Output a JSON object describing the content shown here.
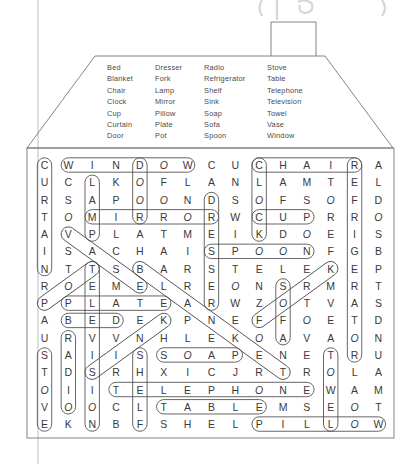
{
  "header": {
    "partial_title": "(page ...)"
  },
  "word_list": {
    "columns": [
      [
        "Bed",
        "Blanket",
        "Chair",
        "Clock",
        "Cup",
        "Curtain",
        "Door"
      ],
      [
        "Dresser",
        "Fork",
        "Lamp",
        "Mirror",
        "Pillow",
        "Plate",
        "Pot"
      ],
      [
        "Radio",
        "Refrigerator",
        "Shelf",
        "Sink",
        "Soap",
        "Sofa",
        "Spoon"
      ],
      [
        "Stove",
        "Table",
        "Telephone",
        "Television",
        "Towel",
        "Vase",
        "Window"
      ]
    ]
  },
  "grid": {
    "rows": [
      "CWINDOWCUCHAIRA",
      "UCLKOFLANLAMTEL",
      "RSAPOONDSOFSOFD",
      "TOMIRRORWCUPRRO",
      "AVPLATMEIKDOEIS",
      "ISACHAISPOONFGB",
      "NTTSBARSTELEKEP",
      "ROEMELREONSRMRT",
      "PPLATEARWZOTVAS",
      "ABEDEKPNEFFOETD",
      "URVVNHLEKOAVAON",
      "SAIISSOAPENETRU",
      "TDSRHXICJRTROLA",
      "OIITELEPHONEWAM",
      "VOOCLTABLEMSEOT",
      "EKNBFSHELPILLOW"
    ],
    "italic_letters": "O"
  },
  "found_words": [
    {
      "word": "CURTAIN",
      "start": [
        1,
        1
      ],
      "end": [
        7,
        1
      ]
    },
    {
      "word": "WINDOW",
      "start": [
        1,
        2
      ],
      "end": [
        1,
        7
      ]
    },
    {
      "word": "DOOR",
      "start": [
        1,
        5
      ],
      "end": [
        4,
        5
      ]
    },
    {
      "word": "CHAIR",
      "start": [
        1,
        10
      ],
      "end": [
        1,
        14
      ]
    },
    {
      "word": "REFRIGERATOR",
      "start": [
        1,
        14
      ],
      "end": [
        12,
        14
      ]
    },
    {
      "word": "LAMP",
      "start": [
        2,
        3
      ],
      "end": [
        5,
        3
      ]
    },
    {
      "word": "CLOCK",
      "start": [
        1,
        10
      ],
      "end": [
        5,
        10
      ]
    },
    {
      "word": "MIRROR",
      "start": [
        4,
        3
      ],
      "end": [
        4,
        8
      ]
    },
    {
      "word": "DRESSER",
      "start": [
        3,
        8
      ],
      "end": [
        9,
        8
      ]
    },
    {
      "word": "CUP",
      "start": [
        4,
        10
      ],
      "end": [
        4,
        12
      ]
    },
    {
      "word": "SPOON",
      "start": [
        6,
        8
      ],
      "end": [
        6,
        12
      ]
    },
    {
      "word": "VASE",
      "start": [
        5,
        2
      ],
      "end": [
        8,
        5
      ]
    },
    {
      "word": "BLANKET",
      "start": [
        7,
        5
      ],
      "end": [
        13,
        11
      ]
    },
    {
      "word": "POT",
      "start": [
        9,
        1
      ],
      "end": [
        7,
        3
      ]
    },
    {
      "word": "TELEVISION",
      "start": [
        7,
        3
      ],
      "end": [
        16,
        3
      ]
    },
    {
      "word": "PLATE",
      "start": [
        9,
        2
      ],
      "end": [
        9,
        6
      ]
    },
    {
      "word": "BED",
      "start": [
        10,
        2
      ],
      "end": [
        10,
        4
      ]
    },
    {
      "word": "FORK",
      "start": [
        10,
        10
      ],
      "end": [
        7,
        13
      ]
    },
    {
      "word": "SOFA",
      "start": [
        8,
        11
      ],
      "end": [
        11,
        11
      ]
    },
    {
      "word": "SINK",
      "start": [
        13,
        3
      ],
      "end": [
        10,
        6
      ]
    },
    {
      "word": "RADIO",
      "start": [
        11,
        2
      ],
      "end": [
        15,
        2
      ]
    },
    {
      "word": "STOVE",
      "start": [
        12,
        1
      ],
      "end": [
        16,
        1
      ]
    },
    {
      "word": "SHELF",
      "start": [
        12,
        5
      ],
      "end": [
        16,
        5
      ]
    },
    {
      "word": "SOAP",
      "start": [
        12,
        6
      ],
      "end": [
        12,
        9
      ]
    },
    {
      "word": "TELEPHONE",
      "start": [
        14,
        4
      ],
      "end": [
        14,
        12
      ]
    },
    {
      "word": "TABLE",
      "start": [
        15,
        6
      ],
      "end": [
        15,
        10
      ]
    },
    {
      "word": "TOWEL",
      "start": [
        12,
        13
      ],
      "end": [
        16,
        13
      ]
    },
    {
      "word": "PILLOW",
      "start": [
        16,
        10
      ],
      "end": [
        16,
        15
      ]
    }
  ]
}
